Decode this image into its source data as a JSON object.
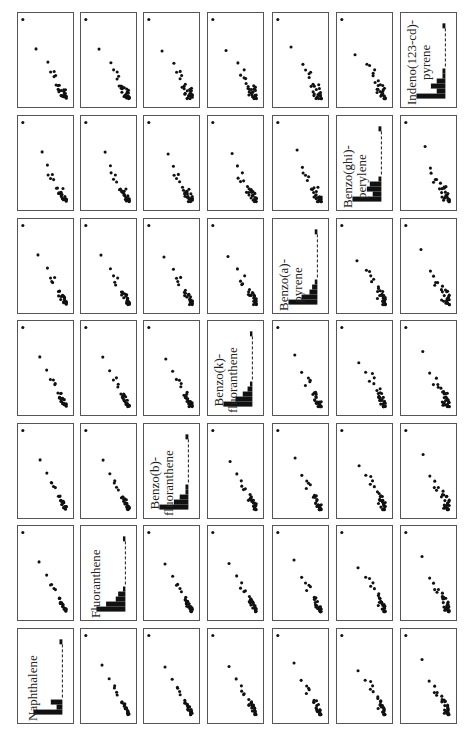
{
  "chart_data": {
    "type": "scatter-matrix",
    "orientation": "rotated 90 degrees counter-clockwise (labels read bottom-to-top)",
    "variables": [
      "Naphthalene",
      "Fluoranthene",
      "Benzo(b)-fluoranthene",
      "Benzo(k)-fluoranthene",
      "Benzo(a)-pyrene",
      "Benzo(ghi)-perylene",
      "Indeno(123-cd)-pyrene"
    ],
    "diagonal_labels": [
      [
        "Naphthalene"
      ],
      [
        "Fluoranthene"
      ],
      [
        "Benzo(b)-",
        "fluoranthene"
      ],
      [
        "Benzo(k)-",
        "fluoranthene"
      ],
      [
        "Benzo(a)-",
        "pyrene"
      ],
      [
        "Benzo(ghi)-",
        "perylene"
      ],
      [
        "Indeno(123-cd)-",
        "pyrene"
      ]
    ],
    "diagonal": "histogram (right-skewed, tallest bin at low values, long dashed tail)",
    "histograms": [
      [
        10,
        2,
        4,
        0,
        0,
        0,
        0,
        0,
        0,
        0,
        0,
        0,
        0,
        0,
        1
      ],
      [
        12,
        8,
        4,
        3,
        1,
        0,
        0,
        0,
        0,
        0,
        0,
        0,
        0,
        0,
        1
      ],
      [
        10,
        5,
        3,
        1,
        1,
        0,
        0,
        0,
        0,
        0,
        0,
        0,
        0,
        0,
        1
      ],
      [
        12,
        7,
        4,
        2,
        1,
        0,
        0,
        0,
        0,
        0,
        0,
        0,
        0,
        0,
        1
      ],
      [
        11,
        6,
        3,
        2,
        1,
        0,
        0,
        0,
        0,
        0,
        0,
        0,
        0,
        0,
        1
      ],
      [
        10,
        3,
        5,
        4,
        1,
        0,
        0,
        0,
        0,
        0,
        0,
        0,
        0,
        0,
        1
      ],
      [
        10,
        3,
        5,
        3,
        1,
        1,
        0,
        0,
        0,
        0,
        0,
        0,
        0,
        0,
        1
      ]
    ],
    "n_points": 30,
    "grid": false,
    "axes_ticks": false,
    "layout": {
      "rows": 7,
      "cols": 7
    },
    "points_seed_note": "approximate point clouds: one outlier at high values, a few mid values, dense cluster at low values"
  },
  "layout": {
    "col_x": [
      17,
      80,
      143,
      207,
      272,
      336,
      400
    ],
    "row_y": [
      12,
      115,
      218,
      320,
      423,
      525,
      628
    ],
    "panel_w": 57,
    "panel_h": 96
  },
  "colors": {
    "point": "#111111",
    "border": "#555555",
    "bar": "#111111"
  }
}
